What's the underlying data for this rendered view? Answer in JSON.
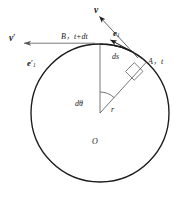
{
  "figure": {
    "type": "geometry-diagram",
    "colors": {
      "stroke": "#1a1a1a",
      "background": "#ffffff",
      "label": "#1a1a1a"
    },
    "geometry": {
      "circle": {
        "cx": 100,
        "cy": 113,
        "r": 69
      },
      "center_label": "O",
      "point_A": {
        "x": 143,
        "y": 59
      },
      "point_B": {
        "x": 100,
        "y": 44
      },
      "radius_value_label": "r",
      "angle_label": "dθ",
      "arc_label": "ds"
    },
    "labels": {
      "v": "v",
      "v_prime_base": "v",
      "v_prime_mark": "′",
      "e1_base": "e",
      "e1_sub": "1",
      "e1_prime_base": "e",
      "e1_prime_mark": "′",
      "e1_prime_sub": "1",
      "point_B_text": "B，t+dt",
      "point_A_text": "A，t",
      "arc_ds": "ds",
      "angle_dtheta": "dθ",
      "radius_r": "r",
      "origin_O": "O"
    }
  }
}
